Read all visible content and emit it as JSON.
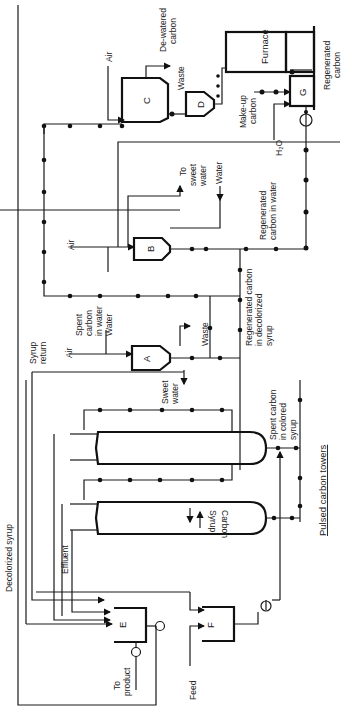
{
  "diagram": {
    "title": "Pulsed carbon towers",
    "orientation": "rotated 90deg counter-clockwise",
    "equipment": [
      {
        "id": "A",
        "label": "A"
      },
      {
        "id": "B",
        "label": "B"
      },
      {
        "id": "C",
        "label": "C"
      },
      {
        "id": "D",
        "label": "D"
      },
      {
        "id": "E",
        "label": "E"
      },
      {
        "id": "F",
        "label": "F"
      },
      {
        "id": "G",
        "label": "G"
      },
      {
        "id": "furnace",
        "label": "Furnace"
      },
      {
        "id": "tower1",
        "label": "Pulsed carbon tower 1"
      },
      {
        "id": "tower2",
        "label": "Pulsed carbon tower 2"
      }
    ],
    "labels": {
      "furnace": "Furnace",
      "regenerated_carbon": "Regenerated carbon",
      "regenerated_carbon_l1": "Regenerated",
      "regenerated_carbon_l2": "carbon",
      "dewatered_l1": "De-watered",
      "dewatered_l2": "carbon",
      "waste": "Waste",
      "air": "Air",
      "makeup_l1": "Make-up",
      "makeup_l2": "carbon",
      "h2o": "H₂O",
      "to_sweet_l1": "To",
      "to_sweet_l2": "sweet",
      "to_sweet_l3": "water",
      "water": "Water",
      "regen_water_l1": "Regenerated",
      "regen_water_l2": "carbon in water",
      "regen_syrup_l1": "Regenerated carbon",
      "regen_syrup_l2": "in decolorized",
      "regen_syrup_l3": "syrup",
      "spent_water_l1": "Spent",
      "spent_water_l2": "carbon",
      "spent_water_l3": "in water",
      "sweet_water_l1": "Sweet",
      "sweet_water_l2": "water",
      "syrup_return_l1": "Syrup",
      "syrup_return_l2": "return",
      "spent_colored_l1": "Spent carbon",
      "spent_colored_l2": "in colored",
      "spent_colored_l3": "syrup",
      "pulsed_towers": "Pulsed carbon towers",
      "syrup": "Syrup",
      "carbon": "Carbon",
      "effluent": "Effluent",
      "decolorized_syrup": "Decolorized syrup",
      "to_product_l1": "To",
      "to_product_l2": "product",
      "feed": "Feed"
    }
  }
}
